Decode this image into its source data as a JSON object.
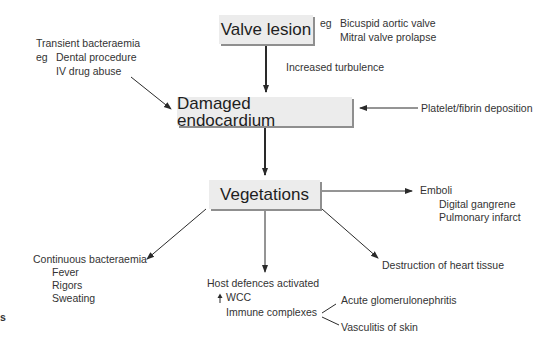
{
  "nodes": {
    "valve_lesion": "Valve lesion",
    "damaged_endocardium": "Damaged endocardium",
    "vegetations": "Vegetations"
  },
  "annotations": {
    "valve_eg": {
      "prefix": "eg",
      "items": [
        "Bicuspid aortic valve",
        "Mitral valve prolapse"
      ]
    },
    "turbulence": "Increased turbulence",
    "transient": {
      "title": "Transient bacteraemia",
      "prefix": "eg",
      "items": [
        "Dental procedure",
        "IV drug abuse"
      ]
    },
    "platelet": "Platelet/fibrin deposition",
    "emboli": {
      "title": "Emboli",
      "items": [
        "Digital gangrene",
        "Pulmonary infarct"
      ]
    },
    "continuous": {
      "title": "Continuous bacteraemia",
      "items": [
        "Fever",
        "Rigors",
        "Sweating"
      ]
    },
    "host": {
      "title": "Host defences activated",
      "wcc": "WCC",
      "immune": "Immune complexes"
    },
    "immune_outcomes": [
      "Acute glomerulonephritis",
      "Vasculitis of skin"
    ],
    "destruction": "Destruction of heart tissue",
    "stray_fragment": "s"
  }
}
